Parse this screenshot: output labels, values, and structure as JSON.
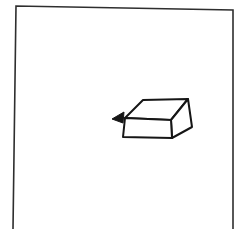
{
  "figure": {
    "background_color": "#ffffff",
    "ink_color": "#161616",
    "frame_color": "#2e2e2e",
    "frame_points": "13,229 16,6 233,10 233,229",
    "box": {
      "top_face_points": "125,118 143,100 188,99 171,120",
      "front_face_points": "125,118 171,120 172,138 123,137",
      "right_face_points": "171,120 188,99 192,127 172,138"
    },
    "arrow_points": "112,119 124,112 123,123"
  }
}
